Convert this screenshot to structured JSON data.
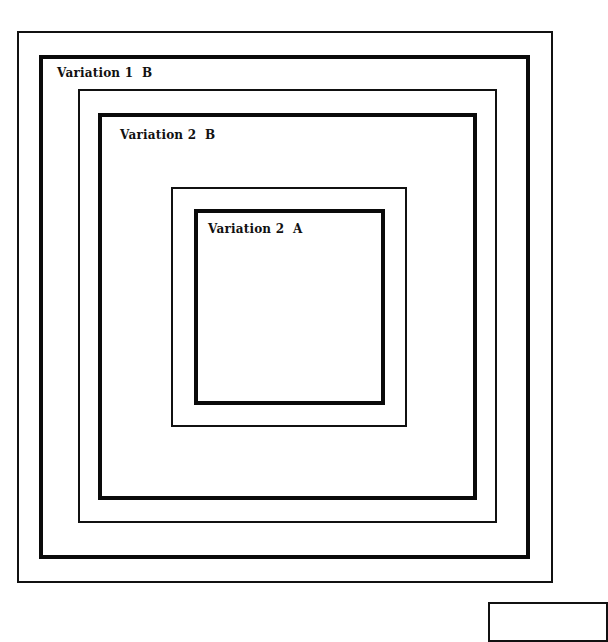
{
  "diagram": {
    "type": "nested-squares",
    "colors": {
      "background": "#ffffff",
      "line": "#111111"
    },
    "boxes": [
      {
        "id": "outer-frame",
        "weight": "thin",
        "left": 17,
        "top": 31,
        "right": 553,
        "bottom": 583,
        "label": ""
      },
      {
        "id": "variation-1b",
        "weight": "thick",
        "left": 39,
        "top": 55,
        "right": 530,
        "bottom": 559,
        "label": "Variation 1  B"
      },
      {
        "id": "spacer-1",
        "weight": "thin",
        "left": 78,
        "top": 89,
        "right": 497,
        "bottom": 523,
        "label": ""
      },
      {
        "id": "variation-2b",
        "weight": "thick",
        "left": 98,
        "top": 113,
        "right": 477,
        "bottom": 500,
        "label": "Variation 2  B"
      },
      {
        "id": "spacer-2",
        "weight": "thin",
        "left": 171,
        "top": 187,
        "right": 407,
        "bottom": 427,
        "label": ""
      },
      {
        "id": "variation-2a",
        "weight": "thick",
        "left": 194,
        "top": 209,
        "right": 385,
        "bottom": 405,
        "label": "Variation 2  A"
      }
    ],
    "labels": {
      "variation_1b": "Variation 1  B",
      "variation_2b": "Variation 2  B",
      "variation_2a": "Variation 2  A"
    },
    "partial_box": {
      "left": 488,
      "top": 602
    }
  }
}
